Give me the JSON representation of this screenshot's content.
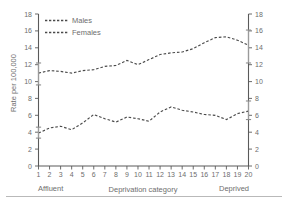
{
  "chart_data": {
    "type": "line",
    "title": "",
    "xlabel": "Deprivation category",
    "ylabel": "Rate per 100,000",
    "x": [
      1,
      2,
      3,
      4,
      5,
      6,
      7,
      8,
      9,
      10,
      11,
      12,
      13,
      14,
      15,
      16,
      17,
      18,
      19,
      20
    ],
    "categories": [
      "1",
      "2",
      "3",
      "4",
      "5",
      "6",
      "7",
      "8",
      "9",
      "10",
      "11",
      "12",
      "13",
      "14",
      "15",
      "16",
      "17",
      "18",
      "19",
      "20"
    ],
    "xlim": [
      1,
      20
    ],
    "ylim": [
      0,
      18
    ],
    "yticks": [
      0,
      2,
      4,
      6,
      8,
      10,
      12,
      14,
      16,
      18
    ],
    "grid": false,
    "legend_position": "top-left",
    "axis_mirrored": true,
    "series": [
      {
        "name": "Males",
        "values": [
          11.0,
          11.3,
          11.2,
          11.0,
          11.3,
          11.4,
          11.8,
          11.9,
          12.5,
          12.0,
          12.6,
          13.2,
          13.4,
          13.5,
          13.9,
          14.6,
          15.2,
          15.3,
          14.9,
          14.3
        ],
        "error_bars": [
          {
            "x": 1,
            "value": 11.0,
            "low": 9.6,
            "high": 12.2
          },
          {
            "x": 20,
            "value": 14.3,
            "low": 12.2,
            "high": 16.1
          }
        ]
      },
      {
        "name": "Females",
        "values": [
          3.9,
          4.5,
          4.7,
          4.3,
          5.1,
          6.1,
          5.6,
          5.2,
          5.8,
          5.6,
          5.3,
          6.4,
          7.0,
          6.6,
          6.4,
          6.1,
          6.0,
          5.5,
          6.2,
          6.5
        ],
        "error_bars": [
          {
            "x": 1,
            "value": 3.9,
            "low": 3.3,
            "high": 4.6
          },
          {
            "x": 20,
            "value": 6.5,
            "low": 5.5,
            "high": 7.7
          }
        ]
      }
    ]
  },
  "axes": {
    "y_label": "Rate per 100,000",
    "y_ticks": [
      "0",
      "2",
      "4",
      "6",
      "8",
      "10",
      "12",
      "14",
      "16",
      "18"
    ],
    "x_label": "Deprivation category",
    "x_ticks": [
      "1",
      "2",
      "3",
      "4",
      "5",
      "6",
      "7",
      "8",
      "9",
      "10",
      "11",
      "12",
      "13",
      "14",
      "15",
      "16",
      "17",
      "18",
      "19",
      "20"
    ],
    "x_end_left": "Affluent",
    "x_end_right": "Deprived"
  },
  "legend": {
    "items": [
      {
        "label": "Males"
      },
      {
        "label": "Females"
      }
    ]
  },
  "colors": {
    "series": "#4a4a4a",
    "axis": "#5a5a5a",
    "text": "#6e6e6e",
    "error_bar": "#9a9a9a",
    "divider": "#b9b9b9",
    "background": "#ffffff"
  }
}
